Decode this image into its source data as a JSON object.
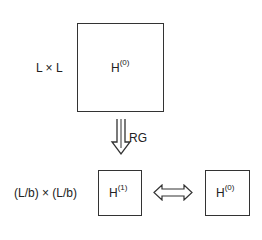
{
  "diagram": {
    "top": {
      "size_label": "L × L",
      "hamiltonian": "H",
      "superscript": "(0)"
    },
    "transform": {
      "arrow": "down-hollow-arrow",
      "label": "RG"
    },
    "bottom": {
      "size_label": "(L/b) × (L/b)",
      "left": {
        "hamiltonian": "H",
        "superscript": "(1)"
      },
      "relation": "double-hollow-arrow",
      "right": {
        "hamiltonian": "H",
        "superscript": "(0)"
      }
    },
    "colors": {
      "line": "#333333",
      "background": "#ffffff"
    }
  }
}
